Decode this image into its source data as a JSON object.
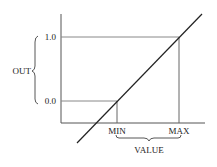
{
  "diagram": {
    "y_axis_label": "OUT",
    "x_axis_label": "VALUE",
    "y_ticks": [
      "1.0",
      "0.0"
    ],
    "x_ticks": [
      "MIN",
      "MAX"
    ],
    "colors": {
      "axis": "#555555",
      "guide": "#777777",
      "line": "#222222"
    }
  }
}
